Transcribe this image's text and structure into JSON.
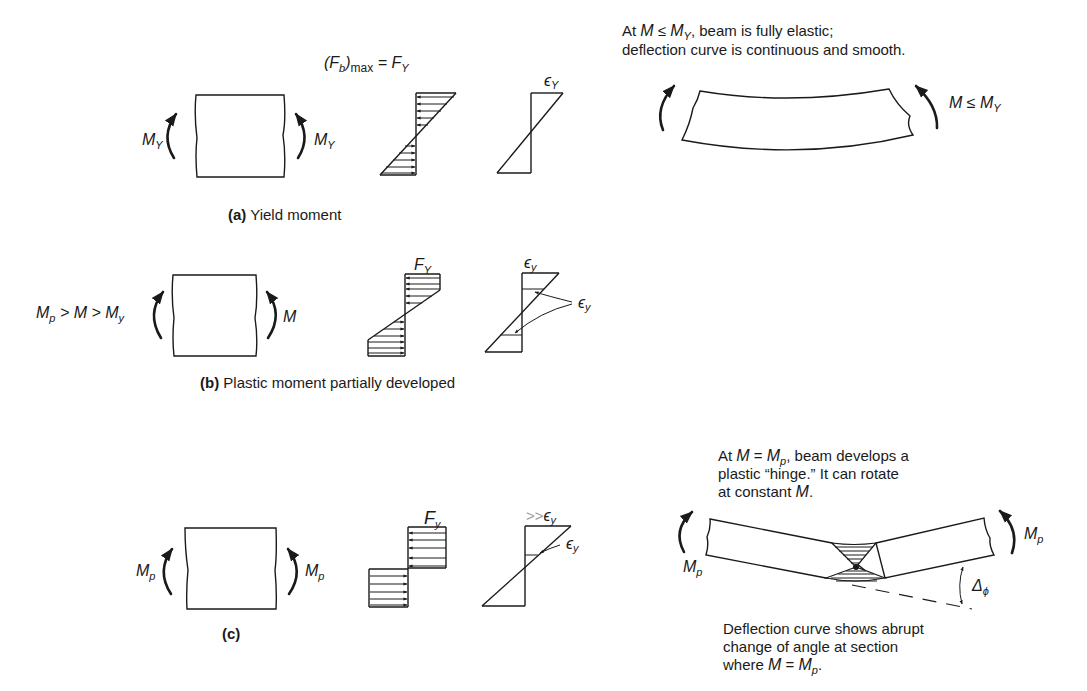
{
  "panel_a": {
    "stress_max_label": "(F",
    "stress_max_sub_b": "b",
    "stress_max_paren": ")",
    "stress_max_sub": "max",
    "stress_max_eq": " = F",
    "stress_max_eq_sub": "Y",
    "moment_left": "M",
    "moment_left_sub": "Y",
    "moment_right": "M",
    "moment_right_sub": "Y",
    "strain_label": "ϵ",
    "strain_label_sub": "Y",
    "caption_letter": "(a)",
    "caption_text": " Yield moment"
  },
  "panel_b": {
    "moment_left_expr_1": "M",
    "moment_left_expr_1_sub": "p",
    "moment_left_expr_2": " > M > M",
    "moment_left_expr_2_sub": "y",
    "moment_right": "M",
    "stress_label": "F",
    "stress_label_sub": "Y",
    "strain_top_label": "ϵ",
    "strain_top_label_sub": "y",
    "strain_side_label": "ϵ",
    "strain_side_label_sub": "y",
    "caption_letter": "(b)",
    "caption_text": " Plastic moment partially developed"
  },
  "panel_c": {
    "moment_left": "M",
    "moment_left_sub": "p",
    "moment_right": "M",
    "moment_right_sub": "p",
    "stress_label": "F",
    "stress_label_sub": "y",
    "strain_top_prefix": ">>",
    "strain_top_label": "ϵ",
    "strain_top_label_sub": "y",
    "strain_side_label": "ϵ",
    "strain_side_label_sub": "y",
    "caption_letter": "(c)"
  },
  "elastic_beam": {
    "note_line1_a": "At ",
    "note_line1_m": "M",
    "note_line1_b": " ≤ ",
    "note_line1_my": "M",
    "note_line1_my_sub": "Y",
    "note_line1_c": ", beam is fully elastic;",
    "note_line2": "deflection curve is continuous and smooth.",
    "moment_label": "M ≤ M",
    "moment_label_sub": "Y"
  },
  "hinge_beam": {
    "note_line1_a": "At ",
    "note_line1_m": "M",
    "note_line1_b": " = ",
    "note_line1_mp": "M",
    "note_line1_mp_sub": "p",
    "note_line1_c": ", beam develops a",
    "note_line2": "plastic “hinge.” It can rotate",
    "note_line3_a": "at constant ",
    "note_line3_m": "M",
    "note_line3_b": ".",
    "moment_left": "M",
    "moment_left_sub": "p",
    "moment_right": "M",
    "moment_right_sub": "p",
    "angle_label": "Δ",
    "angle_label_sub": "ϕ",
    "bottom_line1": "Deflection curve shows abrupt",
    "bottom_line2": "change of angle at section",
    "bottom_line3_a": "where ",
    "bottom_line3_m": "M",
    "bottom_line3_b": " = ",
    "bottom_line3_mp": "M",
    "bottom_line3_mp_sub": "p",
    "bottom_line3_c": "."
  }
}
